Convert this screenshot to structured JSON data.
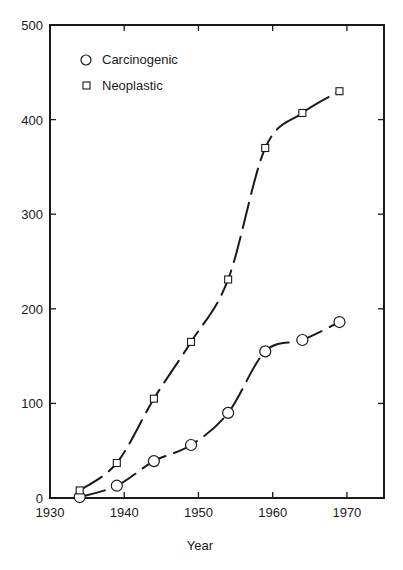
{
  "chart_data": {
    "type": "scatter",
    "title": "",
    "xlabel": "Year",
    "ylabel": "",
    "xlim": [
      1930,
      1975
    ],
    "ylim": [
      0,
      500
    ],
    "x_ticks": [
      1930,
      1940,
      1950,
      1960,
      1970
    ],
    "y_ticks": [
      0,
      100,
      200,
      300,
      400,
      500
    ],
    "grid": false,
    "legend_position": "upper-left (inside)",
    "x": [
      1934,
      1939,
      1944,
      1949,
      1954,
      1959,
      1964,
      1969
    ],
    "series": [
      {
        "name": "Carcinogenic",
        "marker": "circle",
        "values": [
          1,
          13,
          39,
          56,
          90,
          155,
          167,
          186
        ],
        "fit_line": "dashed smooth curve"
      },
      {
        "name": "Neoplastic",
        "marker": "square",
        "values": [
          8,
          37,
          105,
          165,
          231,
          370,
          407,
          430
        ],
        "fit_line": "dashed smooth curve"
      }
    ]
  },
  "legend": {
    "items": [
      {
        "label": "Carcinogenic",
        "marker": "circle"
      },
      {
        "label": "Neoplastic",
        "marker": "square"
      }
    ]
  },
  "axes": {
    "x_title": "Year",
    "x_tick_labels": [
      "1930",
      "1940",
      "1950",
      "1960",
      "1970"
    ],
    "y_tick_labels": [
      "0",
      "100",
      "200",
      "300",
      "400",
      "500"
    ]
  },
  "colors": {
    "ink": "#1a1a1a",
    "background": "#ffffff"
  }
}
